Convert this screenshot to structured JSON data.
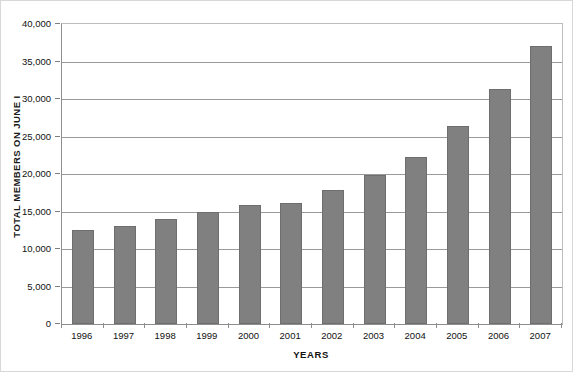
{
  "chart_data": {
    "type": "bar",
    "title": "",
    "xlabel": "YEARS",
    "ylabel": "TOTAL MEMBERS ON JUNE I",
    "categories": [
      "1996",
      "1997",
      "1998",
      "1999",
      "2000",
      "2001",
      "2002",
      "2003",
      "2004",
      "2005",
      "2006",
      "2007"
    ],
    "values": [
      12500,
      13100,
      14000,
      15000,
      15900,
      16200,
      17900,
      19900,
      22300,
      26400,
      31300,
      37100
    ],
    "ylim": [
      0,
      40000
    ],
    "ytick_labels": [
      "0",
      "5,000",
      "10,000",
      "15,000",
      "20,000",
      "25,000",
      "30,000",
      "35,000",
      "40,000"
    ],
    "ytick_values": [
      0,
      5000,
      10000,
      15000,
      20000,
      25000,
      30000,
      35000,
      40000
    ],
    "grid": true,
    "legend": "none",
    "bar_color": "#808080",
    "gridline_color": "#9a9a9a",
    "axis_color": "#8e8e8e",
    "background_color": "#ffffff"
  }
}
